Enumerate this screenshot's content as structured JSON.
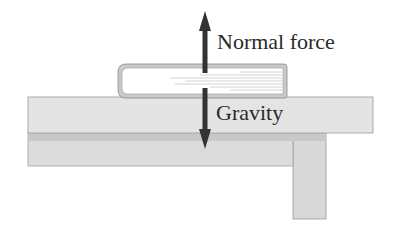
{
  "diagram": {
    "title": "",
    "labels": {
      "normal_force": "Normal force",
      "gravity": "Gravity"
    },
    "objects": [
      "book",
      "table"
    ],
    "forces": [
      {
        "name": "Normal force",
        "direction": "up"
      },
      {
        "name": "Gravity",
        "direction": "down"
      }
    ],
    "colors": {
      "table_top": "#e4e4e4",
      "table_shadow_band": "#c8c8c8",
      "table_apron": "#dcdcdc",
      "table_leg": "#d8d8d8",
      "table_outline": "#9a9a9a",
      "book_cover": "#c9c9c9",
      "book_pages": "#ffffff",
      "arrow": "#333333"
    }
  }
}
